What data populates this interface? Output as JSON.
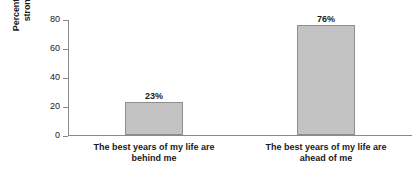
{
  "chart_data": {
    "type": "bar",
    "title": "",
    "xlabel": "",
    "ylabel": "Percent somewhat/ strongly agree",
    "ylabel_lines": [
      "Percent somewhat/",
      "strongly agree"
    ],
    "categories": [
      "The best years of my life are behind me",
      "The best years of my life are ahead of me"
    ],
    "category_lines": [
      [
        "The best years of my life are",
        "behind me"
      ],
      [
        "The best years of my life are",
        "ahead of me"
      ]
    ],
    "values": [
      23,
      76
    ],
    "data_labels": [
      "23%",
      "76%"
    ],
    "ylim": [
      0,
      80
    ],
    "yticks": [
      0,
      20,
      40,
      60,
      80
    ],
    "ytick_labels": [
      "0",
      "20",
      "40",
      "60",
      "80"
    ],
    "grid": false,
    "legend": "none",
    "bar_fill_color": "#c3c3c3",
    "bar_border_color": "#8e8e8e",
    "axis_color": "#8a8a8a",
    "background_color": "#ffffff"
  }
}
